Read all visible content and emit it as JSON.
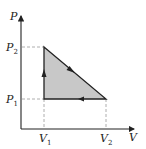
{
  "diagram": {
    "type": "pv-cycle",
    "axes": {
      "y_label": "P",
      "x_label": "V"
    },
    "ticks": {
      "p2": {
        "base": "P",
        "sub": "2"
      },
      "p1": {
        "base": "P",
        "sub": "1"
      },
      "v1": {
        "base": "V",
        "sub": "1"
      },
      "v2": {
        "base": "V",
        "sub": "2"
      }
    },
    "cycle": {
      "vertices": [
        {
          "V": "V1",
          "P": "P2"
        },
        {
          "V": "V2",
          "P": "P1"
        },
        {
          "V": "V1",
          "P": "P1"
        }
      ],
      "direction": [
        "V1,P1 -> V1,P2 (up)",
        "V1,P2 -> V2,P1 (diagonal down-right)",
        "V2,P1 -> V1,P1 (left)"
      ],
      "fill_color": "#c8c8c8",
      "line_color": "#222222"
    }
  }
}
